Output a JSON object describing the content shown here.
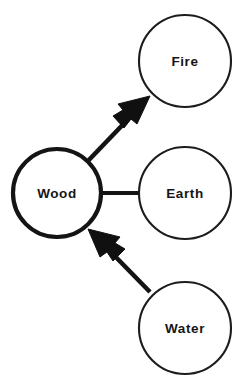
{
  "diagram": {
    "type": "node-link-diagram",
    "background_color": "#ffffff",
    "stroke_color": "#141414",
    "text_color": "#161616",
    "canvas": {
      "width": 237,
      "height": 378
    },
    "nodes": [
      {
        "id": "fire",
        "label": "Fire",
        "cx": 185,
        "cy": 61,
        "r": 46,
        "emphasis": "normal",
        "stroke_width": 2.1
      },
      {
        "id": "wood",
        "label": "Wood",
        "cx": 57,
        "cy": 193,
        "r": 44,
        "emphasis": "bold",
        "stroke_width": 4.2
      },
      {
        "id": "earth",
        "label": "Earth",
        "cx": 185,
        "cy": 193,
        "r": 46,
        "emphasis": "normal",
        "stroke_width": 2.1
      },
      {
        "id": "water",
        "label": "Water",
        "cx": 185,
        "cy": 328,
        "r": 46,
        "emphasis": "normal",
        "stroke_width": 2.1
      }
    ],
    "edges": [
      {
        "id": "wood-to-fire",
        "from": "wood",
        "to": "fire",
        "arrow": "to",
        "x1": 89,
        "y1": 161,
        "x2": 148,
        "y2": 100
      },
      {
        "id": "wood-to-earth",
        "from": "wood",
        "to": "earth",
        "arrow": "none",
        "x1": 101,
        "y1": 193,
        "x2": 139,
        "y2": 193
      },
      {
        "id": "water-to-wood",
        "from": "water",
        "to": "wood",
        "arrow": "to",
        "x1": 152,
        "y1": 291,
        "x2": 92,
        "y2": 231
      }
    ]
  }
}
